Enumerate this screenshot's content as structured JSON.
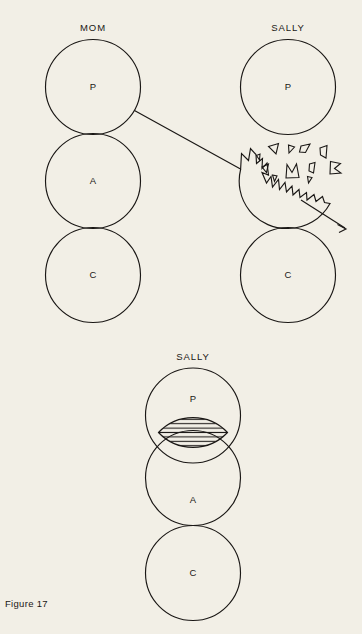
{
  "figure": {
    "caption": "Figure 17",
    "page_background": "#f2efe6",
    "ink_color": "#1a1715"
  },
  "diagrams": [
    {
      "id": "top-transaction",
      "persons": [
        {
          "name": "MOM",
          "label": "MOM",
          "states": [
            {
              "key": "P",
              "label": "P",
              "name": "Parent",
              "state": "intact"
            },
            {
              "key": "A",
              "label": "A",
              "name": "Adult",
              "state": "intact"
            },
            {
              "key": "C",
              "label": "C",
              "name": "Child",
              "state": "intact"
            }
          ]
        },
        {
          "name": "SALLY",
          "label": "SALLY",
          "states": [
            {
              "key": "P",
              "label": "P",
              "name": "Parent",
              "state": "intact"
            },
            {
              "key": "A",
              "label": "A",
              "name": "Adult",
              "state": "shattered"
            },
            {
              "key": "C",
              "label": "C",
              "name": "Child",
              "state": "intact"
            }
          ]
        }
      ],
      "transaction": {
        "from": "MOM.P",
        "to": "SALLY.A",
        "style": "straight-line"
      },
      "explosion": {
        "fragment_count": 11,
        "arrow": "outward-right-down"
      }
    },
    {
      "id": "bottom-contamination",
      "persons": [
        {
          "name": "SALLY",
          "label": "SALLY",
          "states": [
            {
              "key": "P",
              "label": "P",
              "name": "Parent",
              "state": "overlapping"
            },
            {
              "key": "A",
              "label": "A",
              "name": "Adult",
              "state": "overlapping"
            },
            {
              "key": "C",
              "label": "C",
              "name": "Child",
              "state": "intact"
            }
          ]
        }
      ],
      "overlap": {
        "between": [
          "P",
          "A"
        ],
        "fill": "horizontal-hatching",
        "meaning_label": ""
      }
    }
  ]
}
